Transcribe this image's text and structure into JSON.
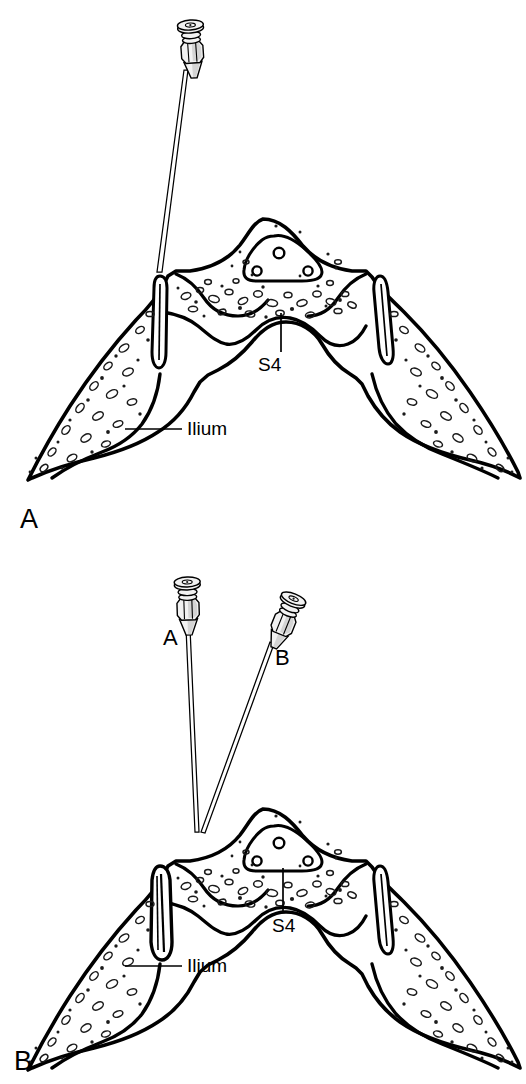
{
  "figure": {
    "kind": "medical-line-illustration",
    "background_color": "#ffffff",
    "ink_color": "#000000",
    "width": 526,
    "height": 1084
  },
  "panels": [
    {
      "id": "A",
      "letter": "A",
      "letter_pos": {
        "x": 20,
        "y": 528
      },
      "needle_count": 1,
      "needles": [
        {
          "id": "a1",
          "label": "",
          "hub": {
            "x": 192,
            "y": 48,
            "rotation": -4
          },
          "tip": {
            "x": 160,
            "y": 272
          }
        }
      ],
      "labels": [
        {
          "name": "s4",
          "text": "S4",
          "text_pos": {
            "x": 258,
            "y": 371
          },
          "leader": {
            "x1": 281,
            "y1": 313,
            "x2": 281,
            "y2": 352
          },
          "leader_orientation": "vertical"
        },
        {
          "name": "ilium",
          "text": "Ilium",
          "text_pos": {
            "x": 187,
            "y": 435
          },
          "leader": {
            "x1": 125,
            "y1": 429,
            "x2": 182,
            "y2": 429
          },
          "leader_orientation": "horizontal"
        }
      ]
    },
    {
      "id": "B",
      "letter": "B",
      "letter_pos": {
        "x": 14,
        "y": 1070
      },
      "needle_count": 2,
      "needles": [
        {
          "id": "b1",
          "label": "A",
          "label_pos": {
            "x": 163,
            "y": 645
          },
          "hub": {
            "x": 188,
            "y": 605,
            "rotation": -2
          },
          "tip": {
            "x": 196,
            "y": 832
          }
        },
        {
          "id": "b2",
          "label": "B",
          "label_pos": {
            "x": 275,
            "y": 665
          },
          "hub": {
            "x": 285,
            "y": 620,
            "rotation": 22
          },
          "tip": {
            "x": 200,
            "y": 832
          }
        }
      ],
      "labels": [
        {
          "name": "s4",
          "text": "S4",
          "text_pos": {
            "x": 272,
            "y": 932
          },
          "leader": {
            "x1": 283,
            "y1": 868,
            "x2": 283,
            "y2": 913
          },
          "leader_orientation": "vertical"
        },
        {
          "name": "ilium",
          "text": "Ilium",
          "text_pos": {
            "x": 187,
            "y": 972
          },
          "leader": {
            "x1": 125,
            "y1": 966,
            "x2": 182,
            "y2": 966
          },
          "leader_orientation": "horizontal"
        }
      ]
    }
  ],
  "anatomy": {
    "structures": [
      {
        "name": "sacrum",
        "description": "Central sacral body with cancellous bone texture"
      },
      {
        "name": "sacral-canal",
        "description": "Triangular canal outline containing three foramina"
      },
      {
        "name": "sacroiliac-joint-left",
        "description": "Narrow elongated joint space, needle target"
      },
      {
        "name": "sacroiliac-joint-right",
        "description": "Narrow elongated joint space"
      },
      {
        "name": "ilium-left",
        "description": "Left iliac wing"
      },
      {
        "name": "ilium-right",
        "description": "Right iliac wing"
      }
    ],
    "foramina_count": 3
  }
}
